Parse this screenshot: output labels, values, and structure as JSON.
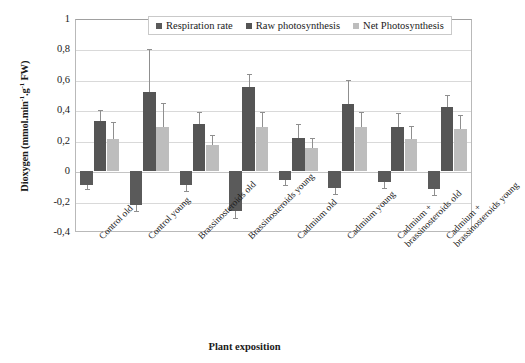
{
  "chart_data": {
    "type": "bar",
    "title": "",
    "xlabel": "Plant exposition",
    "ylabel": "Dioxygen (mmol.min-1.g-1 FW)",
    "ylabel_parts": {
      "main": "Dioxygen (mmol.min",
      "sup1": "-1",
      "mid": ".g",
      "sup2": "-1",
      "tail": " FW)"
    },
    "ylim": [
      -0.4,
      1
    ],
    "ytick_labels": [
      "1",
      "0,8",
      "0,6",
      "0,4",
      "0,2",
      "0",
      "-0,2",
      "-0,4"
    ],
    "ytick_values": [
      1,
      0.8,
      0.6,
      0.4,
      0.2,
      0,
      -0.2,
      -0.4
    ],
    "grid": true,
    "legend_position": "top-center",
    "categories": [
      "Control old",
      "Control young",
      "Brassinosteroids old",
      "Brassinosteroids young",
      "Cadmium old",
      "Cadmium young",
      "Cadmium + brassinosteroids old",
      "Cadmium + brassinosteroids young"
    ],
    "series": [
      {
        "name": "Respiration rate",
        "color": "#5a5a5a",
        "values": [
          -0.09,
          -0.22,
          -0.09,
          -0.26,
          -0.06,
          -0.11,
          -0.07,
          -0.12
        ],
        "errors": [
          0.03,
          0.04,
          0.04,
          0.05,
          0.03,
          0.04,
          0.04,
          0.04
        ]
      },
      {
        "name": "Raw photosynthesis",
        "color": "#555555",
        "values": [
          0.33,
          0.52,
          0.31,
          0.55,
          0.22,
          0.44,
          0.29,
          0.42
        ],
        "errors": [
          0.07,
          0.28,
          0.08,
          0.09,
          0.09,
          0.16,
          0.09,
          0.08
        ]
      },
      {
        "name": "Net Photosynthesis",
        "color": "#bdbdbd",
        "values": [
          0.21,
          0.29,
          0.17,
          0.29,
          0.15,
          0.29,
          0.21,
          0.28
        ],
        "errors": [
          0.11,
          0.16,
          0.07,
          0.1,
          0.07,
          0.1,
          0.09,
          0.09
        ]
      }
    ]
  }
}
